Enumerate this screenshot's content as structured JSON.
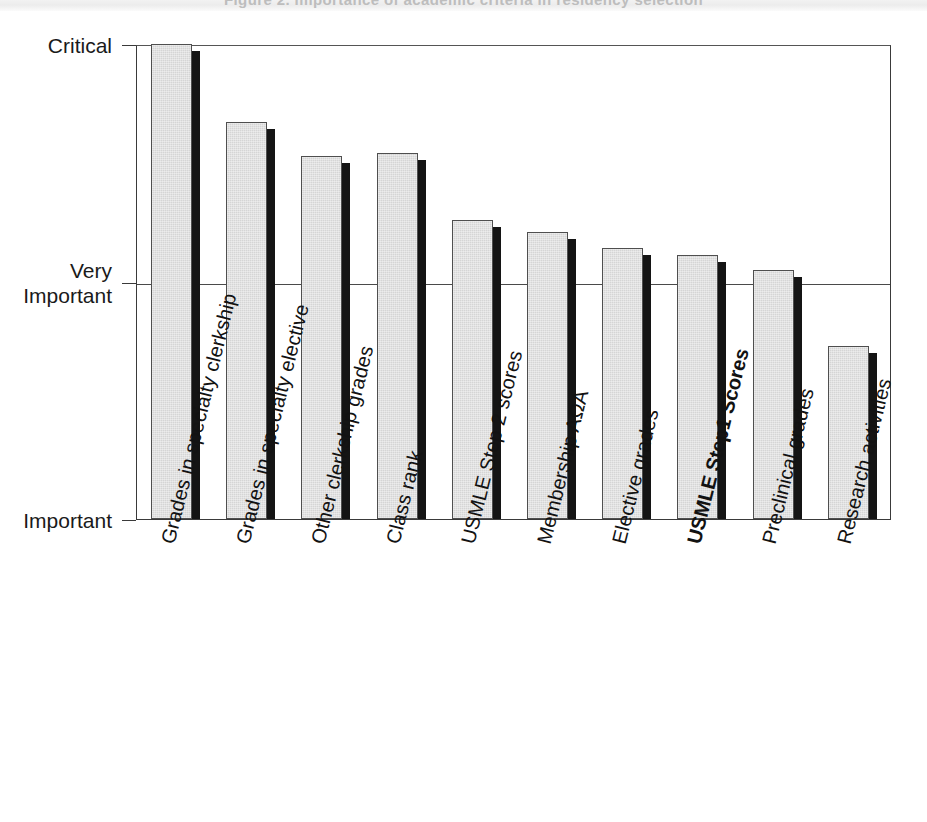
{
  "figure": {
    "background_color": "#ffffff",
    "bar_face_color": "#d5d5d5",
    "bar_shadow_color": "#141414",
    "axis_color": "#3a3a3a",
    "ghost_title": "Figure 2. Importance of academic criteria in residency selection"
  },
  "chart_data": {
    "type": "bar",
    "title": "",
    "subtitle": "",
    "xlabel": "",
    "ylabel": "",
    "orientation": "vertical",
    "grid": true,
    "gridlines": [
      "Very Important"
    ],
    "legend": null,
    "legend_position": "none",
    "annotations": [],
    "y_tick_labels": [
      "Important",
      "Very Important",
      "Critical"
    ],
    "y_tick_values": [
      0,
      1,
      2
    ],
    "ylim": [
      0,
      2
    ],
    "value_scale_note": "Important = 0, Very Important = 1, Critical = 2",
    "highlighted_category": "USMLE Step1 Scores",
    "categories": [
      "Grades in specialty clerkship",
      "Grades in specialty elective",
      "Other clerkship grades",
      "Class rank",
      "USMLE Step 2 scores",
      "Membership AΩA",
      "Elective grades",
      "USMLE Step1 Scores",
      "Preclinical grades",
      "Research activities"
    ],
    "values": [
      2.0,
      1.67,
      1.53,
      1.54,
      1.26,
      1.21,
      1.14,
      1.11,
      1.05,
      0.73
    ],
    "bars": [
      {
        "label": "Grades in specialty clerkship",
        "value": 2.0,
        "bold": false
      },
      {
        "label": "Grades in specialty elective",
        "value": 1.67,
        "bold": false
      },
      {
        "label": "Other clerkship grades",
        "value": 1.53,
        "bold": false
      },
      {
        "label": "Class rank",
        "value": 1.54,
        "bold": false
      },
      {
        "label": "USMLE Step 2 scores",
        "value": 1.26,
        "bold": false
      },
      {
        "label": "Membership AΩA",
        "value": 1.21,
        "bold": false
      },
      {
        "label": "Elective grades",
        "value": 1.14,
        "bold": false
      },
      {
        "label": "USMLE Step1 Scores",
        "value": 1.11,
        "bold": true
      },
      {
        "label": "Preclinical grades",
        "value": 1.05,
        "bold": false
      },
      {
        "label": "Research activities",
        "value": 0.73,
        "bold": false
      }
    ]
  },
  "y_axis": {
    "ticks": [
      {
        "label": "Critical",
        "value": 2
      },
      {
        "label": "Very\nImportant",
        "value": 1
      },
      {
        "label": "Important",
        "value": 0
      }
    ]
  }
}
